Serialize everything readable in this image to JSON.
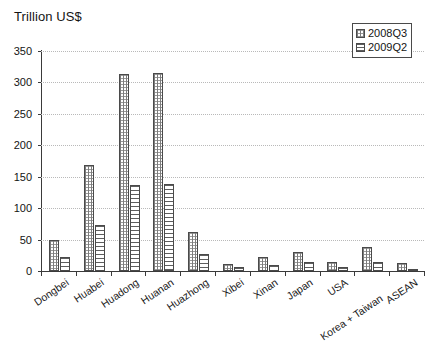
{
  "chart_data": {
    "type": "bar",
    "title": "Trillion US$",
    "xlabel": "",
    "ylabel": "",
    "ylim": [
      0,
      350
    ],
    "yticks": [
      0,
      50,
      100,
      150,
      200,
      250,
      300,
      350
    ],
    "grid": true,
    "legend_position": "top-right",
    "categories": [
      "Dongbei",
      "Huabei",
      "Huadong",
      "Huanan",
      "Huazhong",
      "Xibei",
      "Xinan",
      "Japan",
      "USA",
      "Korea + Taiwan",
      "ASEAN"
    ],
    "series": [
      {
        "name": "2008Q3",
        "pattern": "dotted-grid",
        "values": [
          50,
          168,
          313,
          315,
          62,
          11,
          23,
          30,
          15,
          38,
          13
        ]
      },
      {
        "name": "2009Q2",
        "pattern": "horizontal-lines",
        "values": [
          22,
          73,
          137,
          139,
          27,
          6,
          10,
          15,
          6,
          14,
          2
        ]
      }
    ]
  },
  "legend": {
    "entries": [
      "2008Q3",
      "2009Q2"
    ]
  },
  "colors": {
    "axis": "#3a3a3a",
    "grid": "#b9b9b9",
    "bar_outline": "#4a4a4a",
    "text": "#141414",
    "background": "#ffffff"
  }
}
